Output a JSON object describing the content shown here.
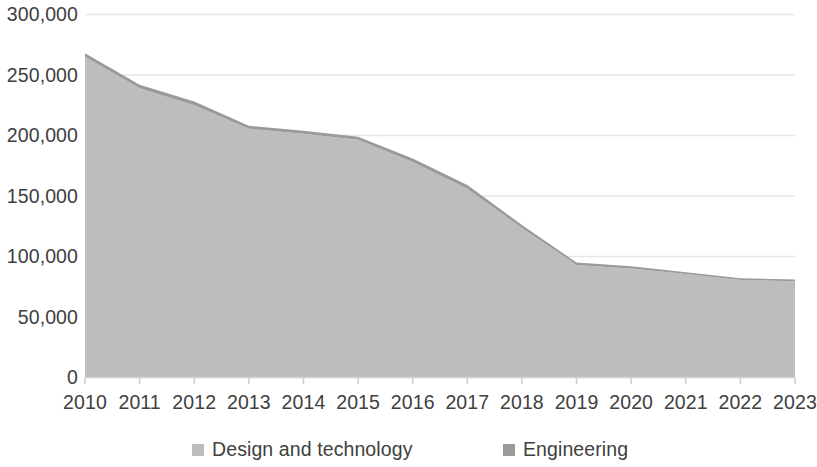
{
  "chart_data": {
    "type": "area",
    "stacked": true,
    "title": "",
    "subtitle": "",
    "xlabel": "",
    "ylabel": "",
    "categories": [
      "2010",
      "2011",
      "2012",
      "2013",
      "2014",
      "2015",
      "2016",
      "2017",
      "2018",
      "2019",
      "2020",
      "2021",
      "2022",
      "2023"
    ],
    "series": [
      {
        "name": "Design and technology",
        "color": "#bdbdbd",
        "values": [
          265000,
          239000,
          225000,
          205500,
          201500,
          196500,
          178000,
          156000,
          123500,
          93000,
          90000,
          85500,
          80500,
          79500
        ]
      },
      {
        "name": "Engineering",
        "color": "#9a9a9a",
        "values": [
          3000,
          3000,
          3000,
          2500,
          2500,
          2500,
          3000,
          3000,
          2500,
          2000,
          2000,
          1500,
          1500,
          1500
        ]
      }
    ],
    "totals": [
      268000,
      242000,
      228000,
      208000,
      204000,
      199000,
      181000,
      159000,
      126000,
      95000,
      92000,
      87000,
      82000,
      81000
    ],
    "ylim": [
      0,
      300000
    ],
    "y_ticks": [
      300000,
      250000,
      200000,
      150000,
      100000,
      50000,
      0
    ],
    "y_tick_labels": [
      "300,000",
      "250,000",
      "200,000",
      "150,000",
      "100,000",
      "50,000",
      "0"
    ],
    "x_tick_labels": [
      "2010",
      "2011",
      "2012",
      "2013",
      "2014",
      "2015",
      "2016",
      "2017",
      "2018",
      "2019",
      "2020",
      "2021",
      "2022",
      "2023"
    ],
    "grid": "horizontal",
    "grid_color": "#e6e6e6",
    "axis_color": "#d0d0d0",
    "text_color": "#404040",
    "background": "#ffffff",
    "legend_position": "bottom"
  },
  "legend": {
    "items": [
      {
        "label": "Design and technology",
        "color": "#bdbdbd"
      },
      {
        "label": "Engineering",
        "color": "#9a9a9a"
      }
    ]
  }
}
